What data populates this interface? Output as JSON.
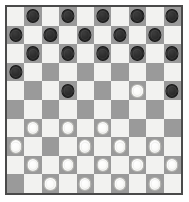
{
  "board": {
    "game": "International Draughts",
    "rows": 10,
    "columns": 10,
    "light_square_color": "#f2f2f0",
    "dark_square_color": "#9a9a9a",
    "border_color": "#4a4a4a",
    "dark_piece_color": "#2b2b2b",
    "light_piece_color": "#fafaf8",
    "dark_piece_count": 19,
    "light_piece_count": 17,
    "orientation": "dark-top-light-bottom",
    "grid": [
      [
        "",
        "D",
        "",
        "D",
        "",
        "D",
        "",
        "D",
        "",
        "D"
      ],
      [
        "D",
        "",
        "D",
        "",
        "D",
        "",
        "D",
        "",
        "D",
        ""
      ],
      [
        "",
        "D",
        "",
        "D",
        "",
        "D",
        "",
        "D",
        "",
        "D"
      ],
      [
        "D",
        "",
        "",
        "",
        "",
        "",
        "",
        "",
        "",
        ""
      ],
      [
        "",
        "",
        "",
        "D",
        "",
        "",
        "",
        "L",
        "",
        "D"
      ],
      [
        "",
        "",
        "",
        "",
        "",
        "",
        "",
        "",
        "",
        ""
      ],
      [
        "",
        "L",
        "",
        "L",
        "",
        "L",
        "",
        "",
        "",
        ""
      ],
      [
        "L",
        "",
        "",
        "",
        "L",
        "",
        "L",
        "",
        "L",
        ""
      ],
      [
        "",
        "L",
        "",
        "L",
        "",
        "L",
        "",
        "L",
        "",
        "L"
      ],
      [
        "",
        "",
        "L",
        "",
        "L",
        "",
        "L",
        "",
        "L",
        ""
      ]
    ],
    "legend": {
      "D": "dark-piece",
      "L": "light-piece",
      "": "empty"
    }
  }
}
